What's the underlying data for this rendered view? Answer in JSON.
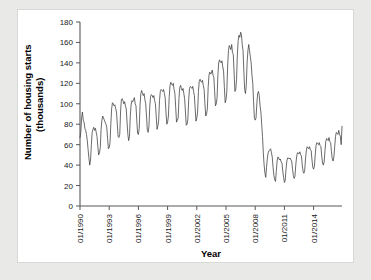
{
  "figure": {
    "background_color": "#e9e9e7",
    "card_color": "#ffffff",
    "line_color": "#3a3a3c",
    "axis_color": "#58585a"
  },
  "axes": {
    "y_title_line1": "Number of housing starts",
    "y_title_line2": "(thousands)",
    "x_title": "Year",
    "y_ticks": [
      "0",
      "20",
      "40",
      "60",
      "80",
      "100",
      "120",
      "140",
      "160",
      "180"
    ],
    "x_ticks": [
      "01/1990",
      "01/1993",
      "01/1996",
      "01/1999",
      "01/2002",
      "01/2005",
      "01/2008",
      "01/2011",
      "01/2014"
    ]
  },
  "chart_data": {
    "type": "line",
    "title": "",
    "xlabel": "Year",
    "ylabel": "Number of housing starts (thousands)",
    "ylim": [
      0,
      180
    ],
    "ytick_step": 20,
    "grid": false,
    "legend": "none",
    "x_tick_labels": [
      "01/1990",
      "01/1993",
      "01/1996",
      "01/1999",
      "01/2002",
      "01/2005",
      "01/2008",
      "01/2011",
      "01/2014"
    ],
    "x_tick_index": [
      0,
      36,
      72,
      108,
      144,
      180,
      216,
      252,
      288
    ],
    "x_start": "01/1990",
    "x_end": "12/2016",
    "frequency": "monthly",
    "series": [
      {
        "name": "Housing starts",
        "units": "thousands",
        "values": [
          67,
          72,
          86,
          92,
          84,
          82,
          76,
          74,
          70,
          64,
          55,
          47,
          40,
          45,
          60,
          72,
          75,
          77,
          74,
          76,
          72,
          68,
          58,
          50,
          52,
          57,
          75,
          84,
          88,
          86,
          84,
          82,
          80,
          77,
          66,
          56,
          57,
          62,
          80,
          95,
          101,
          100,
          98,
          99,
          95,
          92,
          80,
          68,
          67,
          70,
          92,
          104,
          105,
          103,
          100,
          102,
          98,
          95,
          82,
          70,
          64,
          68,
          88,
          99,
          103,
          102,
          104,
          106,
          100,
          98,
          84,
          71,
          70,
          76,
          98,
          110,
          113,
          110,
          108,
          110,
          104,
          100,
          88,
          74,
          72,
          78,
          97,
          107,
          109,
          108,
          106,
          108,
          103,
          100,
          87,
          75,
          78,
          84,
          103,
          112,
          114,
          113,
          112,
          114,
          110,
          106,
          92,
          80,
          82,
          88,
          107,
          118,
          121,
          119,
          118,
          120,
          114,
          110,
          96,
          82,
          84,
          86,
          105,
          116,
          118,
          115,
          113,
          115,
          110,
          105,
          92,
          79,
          80,
          85,
          104,
          115,
          117,
          116,
          115,
          117,
          112,
          108,
          95,
          83,
          86,
          92,
          112,
          122,
          124,
          122,
          121,
          123,
          118,
          114,
          100,
          88,
          90,
          95,
          116,
          128,
          131,
          129,
          130,
          133,
          128,
          126,
          112,
          98,
          100,
          106,
          128,
          140,
          143,
          141,
          140,
          142,
          136,
          132,
          116,
          101,
          104,
          112,
          136,
          152,
          157,
          155,
          153,
          158,
          150,
          148,
          130,
          112,
          114,
          124,
          148,
          162,
          167,
          165,
          170,
          168,
          158,
          152,
          132,
          114,
          110,
          118,
          140,
          152,
          158,
          152,
          146,
          140,
          128,
          120,
          102,
          86,
          84,
          86,
          100,
          110,
          112,
          108,
          98,
          92,
          80,
          68,
          52,
          40,
          32,
          28,
          38,
          47,
          52,
          54,
          55,
          56,
          52,
          48,
          38,
          30,
          26,
          24,
          34,
          44,
          48,
          47,
          45,
          46,
          43,
          42,
          34,
          28,
          23,
          25,
          36,
          44,
          47,
          47,
          46,
          47,
          45,
          44,
          36,
          30,
          27,
          29,
          40,
          48,
          52,
          52,
          51,
          53,
          50,
          49,
          40,
          34,
          32,
          35,
          46,
          54,
          58,
          57,
          56,
          58,
          55,
          54,
          45,
          38,
          36,
          39,
          50,
          59,
          62,
          61,
          60,
          62,
          59,
          58,
          49,
          42,
          40,
          43,
          54,
          63,
          66,
          65,
          64,
          67,
          63,
          62,
          53,
          46,
          44,
          48,
          58,
          68,
          72,
          71,
          70,
          74,
          70,
          68,
          60,
          78
        ]
      }
    ]
  }
}
